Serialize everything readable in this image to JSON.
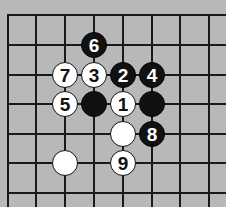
{
  "board": {
    "background": "#b8b8b8",
    "columns_x": [
      8,
      36,
      65,
      94,
      123,
      152,
      180,
      209
    ],
    "rows_y": [
      15,
      45,
      75,
      104,
      134,
      163,
      193
    ],
    "left_edge_visible": true,
    "top_edge_visible": true
  },
  "stones": [
    {
      "color": "black",
      "col": 3,
      "row": 1,
      "label": "6"
    },
    {
      "color": "white",
      "col": 2,
      "row": 2,
      "label": "7"
    },
    {
      "color": "white",
      "col": 3,
      "row": 2,
      "label": "3"
    },
    {
      "color": "black",
      "col": 4,
      "row": 2,
      "label": "2"
    },
    {
      "color": "black",
      "col": 5,
      "row": 2,
      "label": "4"
    },
    {
      "color": "white",
      "col": 2,
      "row": 3,
      "label": "5"
    },
    {
      "color": "black",
      "col": 3,
      "row": 3,
      "label": ""
    },
    {
      "color": "white",
      "col": 4,
      "row": 3,
      "label": "1"
    },
    {
      "color": "black",
      "col": 5,
      "row": 3,
      "label": ""
    },
    {
      "color": "white",
      "col": 4,
      "row": 4,
      "label": ""
    },
    {
      "color": "black",
      "col": 5,
      "row": 4,
      "label": "8"
    },
    {
      "color": "white",
      "col": 2,
      "row": 5,
      "label": ""
    },
    {
      "color": "white",
      "col": 4,
      "row": 5,
      "label": "9"
    }
  ]
}
